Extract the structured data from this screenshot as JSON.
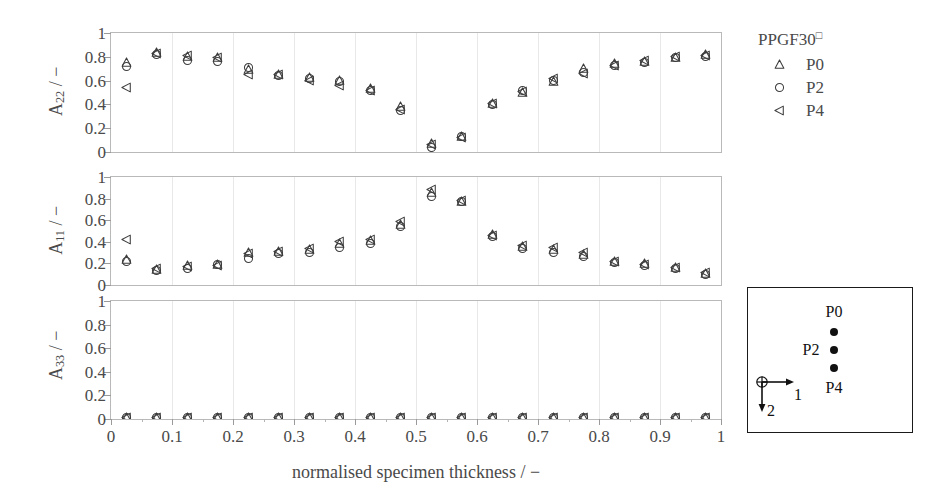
{
  "chart_data": {
    "type": "scatter",
    "title": "",
    "xlabel": "normalised specimen thickness / −",
    "xlim": [
      0,
      1
    ],
    "xticks": [
      0,
      0.1,
      0.2,
      0.3,
      0.4,
      0.5,
      0.6,
      0.7,
      0.8,
      0.9,
      1
    ],
    "xtick_labels": [
      "0",
      "0.1",
      "0.2",
      "0.3",
      "0.4",
      "0.5",
      "0.6",
      "0.7",
      "0.8",
      "0.9",
      "1"
    ],
    "grid": true,
    "legend_position": "right-top",
    "legend_title": "PPGF30",
    "legend_title_superscript": "□",
    "series_markers": [
      {
        "name": "P0",
        "marker": "triangle-up-open"
      },
      {
        "name": "P2",
        "marker": "circle-open"
      },
      {
        "name": "P4",
        "marker": "triangle-left-open"
      }
    ],
    "x": [
      0.025,
      0.075,
      0.125,
      0.175,
      0.225,
      0.275,
      0.325,
      0.375,
      0.425,
      0.475,
      0.525,
      0.575,
      0.625,
      0.675,
      0.725,
      0.775,
      0.825,
      0.875,
      0.925,
      0.975
    ],
    "panels": [
      {
        "ylabel": "A",
        "ylabel_sub": "22",
        "ylabel_unit": "/ −",
        "ylim": [
          0,
          1
        ],
        "yticks": [
          0,
          0.2,
          0.4,
          0.6,
          0.8,
          1
        ],
        "ytick_labels": [
          "0",
          "0.2",
          "0.4",
          "0.6",
          "0.8",
          "1"
        ],
        "series": [
          {
            "name": "P0",
            "marker": "triangle-up-open",
            "values": [
              0.75,
              0.84,
              0.8,
              0.79,
              0.69,
              0.65,
              0.63,
              0.6,
              0.53,
              0.38,
              0.07,
              0.13,
              0.41,
              0.5,
              0.59,
              0.7,
              0.74,
              0.76,
              0.79,
              0.82
            ]
          },
          {
            "name": "P2",
            "marker": "circle-open",
            "values": [
              0.72,
              0.82,
              0.77,
              0.76,
              0.71,
              0.64,
              0.62,
              0.59,
              0.52,
              0.35,
              0.04,
              0.13,
              0.4,
              0.52,
              0.6,
              0.67,
              0.73,
              0.75,
              0.79,
              0.8
            ]
          },
          {
            "name": "P4",
            "marker": "triangle-left-open",
            "values": [
              0.54,
              0.83,
              0.81,
              0.79,
              0.65,
              0.65,
              0.6,
              0.56,
              0.52,
              0.36,
              0.06,
              0.12,
              0.41,
              0.51,
              0.62,
              0.66,
              0.73,
              0.77,
              0.8,
              0.81
            ]
          }
        ]
      },
      {
        "ylabel": "A",
        "ylabel_sub": "11",
        "ylabel_unit": "/ −",
        "ylim": [
          0,
          1
        ],
        "yticks": [
          0,
          0.2,
          0.4,
          0.6,
          0.8,
          1
        ],
        "ytick_labels": [
          "0",
          "0.2",
          "0.4",
          "0.6",
          "0.8",
          "1"
        ],
        "series": [
          {
            "name": "P0",
            "marker": "triangle-up-open",
            "values": [
              0.24,
              0.14,
              0.18,
              0.19,
              0.3,
              0.31,
              0.33,
              0.38,
              0.41,
              0.56,
              0.86,
              0.77,
              0.47,
              0.36,
              0.33,
              0.28,
              0.22,
              0.2,
              0.16,
              0.11
            ]
          },
          {
            "name": "P2",
            "marker": "circle-open",
            "values": [
              0.22,
              0.13,
              0.15,
              0.19,
              0.25,
              0.29,
              0.3,
              0.35,
              0.38,
              0.54,
              0.82,
              0.77,
              0.45,
              0.34,
              0.3,
              0.26,
              0.21,
              0.18,
              0.15,
              0.1
            ]
          },
          {
            "name": "P4",
            "marker": "triangle-left-open",
            "values": [
              0.42,
              0.15,
              0.17,
              0.18,
              0.29,
              0.31,
              0.34,
              0.4,
              0.42,
              0.59,
              0.88,
              0.78,
              0.46,
              0.37,
              0.35,
              0.3,
              0.22,
              0.19,
              0.16,
              0.12
            ]
          }
        ]
      },
      {
        "ylabel": "A",
        "ylabel_sub": "33",
        "ylabel_unit": "/ −",
        "ylim": [
          0,
          1
        ],
        "yticks": [
          0,
          0.2,
          0.4,
          0.6,
          0.8,
          1
        ],
        "ytick_labels": [
          "0",
          "0.2",
          "0.4",
          "0.6",
          "0.8",
          "1"
        ],
        "series": [
          {
            "name": "P0",
            "marker": "triangle-up-open",
            "values": [
              0.01,
              0.01,
              0.01,
              0.01,
              0.01,
              0.01,
              0.01,
              0.01,
              0.01,
              0.01,
              0.01,
              0.01,
              0.01,
              0.01,
              0.01,
              0.01,
              0.01,
              0.01,
              0.01,
              0.01
            ]
          },
          {
            "name": "P2",
            "marker": "circle-open",
            "values": [
              0.01,
              0.01,
              0.01,
              0.01,
              0.01,
              0.01,
              0.01,
              0.01,
              0.01,
              0.01,
              0.01,
              0.01,
              0.01,
              0.01,
              0.01,
              0.01,
              0.01,
              0.01,
              0.01,
              0.01
            ]
          },
          {
            "name": "P4",
            "marker": "triangle-left-open",
            "values": [
              0.01,
              0.01,
              0.01,
              0.01,
              0.01,
              0.01,
              0.01,
              0.01,
              0.01,
              0.01,
              0.01,
              0.01,
              0.01,
              0.01,
              0.01,
              0.01,
              0.01,
              0.01,
              0.01,
              0.01
            ]
          }
        ]
      }
    ]
  },
  "legend": {
    "title": "PPGF30",
    "title_superscript": "□",
    "items": [
      {
        "label": "P0",
        "marker": "triangle-up-open"
      },
      {
        "label": "P2",
        "marker": "circle-open"
      },
      {
        "label": "P4",
        "marker": "triangle-left-open"
      }
    ]
  },
  "inset": {
    "points": [
      {
        "label": "P0",
        "label_pos": "above"
      },
      {
        "label": "P2",
        "label_pos": "left"
      },
      {
        "label": "P4",
        "label_pos": "below"
      }
    ],
    "axis_1_label": "1",
    "axis_2_label": "2",
    "origin_symbol": "⊕"
  },
  "colors": {
    "marker": "#3d3d3d",
    "axis": "#9a9a9a",
    "grid": "#e8e8e8",
    "text": "#4a4a4a",
    "inset_border": "#1a1a1a",
    "inset_ink": "#111111"
  }
}
